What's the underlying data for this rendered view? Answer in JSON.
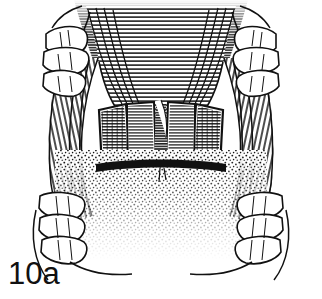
{
  "figure": {
    "caption": "10a",
    "kind": "pen-and-ink surgical line illustration",
    "background_color": "#ffffff",
    "ink_color": "#111111"
  },
  "regions": {
    "palate_vault": {
      "label": "palatal vault",
      "shading": "dense horizontal line hatching following the arch contour"
    },
    "left_arch": {
      "label": "left maxillary alveolar ridge",
      "shading": "long curved parallel hatching"
    },
    "right_arch": {
      "label": "right maxillary alveolar ridge",
      "shading": "long curved parallel hatching"
    },
    "left_flap": {
      "label": "left mucoperiosteal flap",
      "outline": "white relieving incision margin",
      "shading": "cross hatching"
    },
    "right_flap": {
      "label": "right mucoperiosteal flap",
      "outline": "white relieving incision margin",
      "shading": "cross hatching"
    },
    "midline_cleft": {
      "label": "midline cleft / uvular wedge",
      "shading": "unshaded white wedge"
    },
    "pharynx_shadow": {
      "label": "oropharyngeal shadow",
      "shading": "stipple gradient fading inferiorly"
    }
  },
  "teeth": {
    "left_posterior": {
      "label": "left posterior molars",
      "count": 3
    },
    "left_anterior": {
      "label": "left anterior teeth",
      "count": 3
    },
    "right_posterior": {
      "label": "right posterior molars",
      "count": 3
    },
    "right_anterior": {
      "label": "right anterior teeth",
      "count": 3
    }
  }
}
